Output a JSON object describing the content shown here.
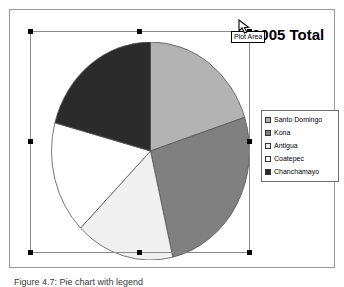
{
  "window": {
    "background_color": "#ffffff"
  },
  "chart": {
    "title": "2005 Total",
    "frame_border_color": "#9a9a9a",
    "selection_label": "plot-area-selection",
    "selection_border_color": "#8a8a8a",
    "handle_color": "#000000"
  },
  "tooltip": {
    "text": "Plot Area"
  },
  "cursor": {
    "icon": "arrow-cursor"
  },
  "sheet": {
    "caption": "Figure 4.7: Pie chart with legend"
  },
  "legend": {
    "position": "right",
    "border_color": "#6f6f6f",
    "items": [
      {
        "label": "Santo Domingo",
        "color": "#b3b3b3"
      },
      {
        "label": "Kona",
        "color": "#808080"
      },
      {
        "label": "Antigua",
        "color": "#f0f0f0"
      },
      {
        "label": "Coatepec",
        "color": "#ffffff"
      },
      {
        "label": "Chanchamayo",
        "color": "#2b2b2b"
      }
    ]
  },
  "chart_data": {
    "type": "pie",
    "title": "2005 Total",
    "xlabel": "",
    "ylabel": "",
    "legend_position": "right",
    "grid": false,
    "start_angle_deg": 0,
    "direction": "clockwise",
    "categories": [
      "Santo Domingo",
      "Kona",
      "Antigua",
      "Coatepec",
      "Chanchamayo"
    ],
    "values": [
      20,
      26.5,
      16,
      16.5,
      21
    ],
    "unit": "percent",
    "slice_angles_deg": [
      72,
      95,
      58,
      60,
      75
    ],
    "colors": [
      "#b3b3b3",
      "#808080",
      "#f0f0f0",
      "#ffffff",
      "#2b2b2b"
    ],
    "slice_outline_color": "#555555"
  }
}
